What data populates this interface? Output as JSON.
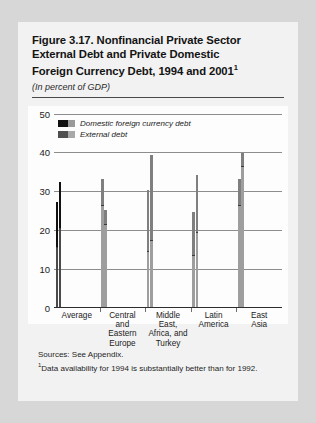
{
  "figure": {
    "title_line1": "Figure 3.17. Nonfinancial Private Sector",
    "title_line2": "External Debt and Private Domestic",
    "title_line3": "Foreign Currency Debt, 1994 and 2001",
    "title_footnote_marker": "1",
    "subtitle": "(In percent of GDP)",
    "sources": "Sources: See Appendix.",
    "footnote_marker": "1",
    "footnote": "Data availability for 1994 is substantially better than for 1992."
  },
  "chart_data": {
    "type": "bar",
    "title": "Figure 3.17. Nonfinancial Private Sector External Debt and Private Domestic Foreign Currency Debt, 1994 and 2001",
    "subtitle": "(In percent of GDP)",
    "xlabel": "",
    "ylabel": "",
    "ylim": [
      0,
      50
    ],
    "yticks": [
      0,
      10,
      20,
      30,
      40,
      50
    ],
    "ytick_labels": [
      "0",
      "10",
      "20",
      "30",
      "40",
      "50"
    ],
    "grid": true,
    "stacked": true,
    "legend_position": "top-left",
    "legend": [
      {
        "name": "Domestic foreign currency debt",
        "color": "#111111"
      },
      {
        "name": "External debt",
        "color": "#9e9e9e"
      }
    ],
    "categories": [
      "Average",
      "Central and Eastern Europe",
      "Middle East, Africa, and Turkey",
      "Latin America",
      "East Asia"
    ],
    "category_label_lines": [
      [
        "Average"
      ],
      [
        "Central",
        "and",
        "Eastern",
        "Europe"
      ],
      [
        "Middle",
        "East,",
        "Africa, and",
        "Turkey"
      ],
      [
        "Latin",
        "America"
      ],
      [
        "East",
        "Asia"
      ]
    ],
    "years": [
      "1994",
      "2001"
    ],
    "series": [
      {
        "name": "External debt",
        "values": [
          {
            "category": "Average",
            "1994": 15.0,
            "2001": 20.0
          },
          {
            "category": "Central and Eastern Europe",
            "1994": 26.0,
            "2001": 21.0
          },
          {
            "category": "Middle East, Africa, and Turkey",
            "1994": 14.0,
            "2001": 17.0
          },
          {
            "category": "Latin America",
            "1994": 13.0,
            "2001": 19.0
          },
          {
            "category": "East Asia",
            "1994": 26.0,
            "2001": 36.0
          }
        ]
      },
      {
        "name": "Domestic foreign currency debt",
        "values": [
          {
            "category": "Average",
            "1994": 12.0,
            "2001": 12.0
          },
          {
            "category": "Central and Eastern Europe",
            "1994": 7.0,
            "2001": 4.0
          },
          {
            "category": "Middle East, Africa, and Turkey",
            "1994": 16.0,
            "2001": 22.0
          },
          {
            "category": "Latin America",
            "1994": 11.5,
            "2001": 15.0
          },
          {
            "category": "East Asia",
            "1994": 7.0,
            "2001": 3.5
          }
        ]
      }
    ],
    "totals": [
      {
        "category": "Average",
        "1994": 27.0,
        "2001": 32.0
      },
      {
        "category": "Central and Eastern Europe",
        "1994": 33.0,
        "2001": 25.0
      },
      {
        "category": "Middle East, Africa, and Turkey",
        "1994": 30.0,
        "2001": 39.0
      },
      {
        "category": "Latin America",
        "1994": 24.5,
        "2001": 34.0
      },
      {
        "category": "East Asia",
        "1994": 33.0,
        "2001": 39.5
      }
    ],
    "colors": {
      "domestic_average": "#111111",
      "external_average": "#4a4a4a",
      "domestic_region": "#7f7f7f",
      "external_region": "#a8a8a8",
      "gridline": "#8d8d8d",
      "axis": "#2d2d2d"
    }
  }
}
